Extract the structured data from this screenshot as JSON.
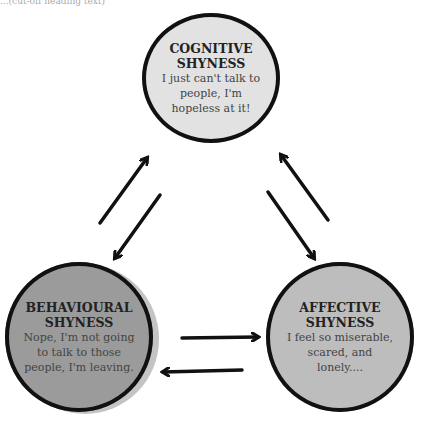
{
  "header": {
    "partial_text": "...(cut-off heading text)"
  },
  "nodes": {
    "cognitive": {
      "title": "COGNITIVE SHYNESS",
      "title_l1": "COGNITIVE",
      "title_l2": "SHYNESS",
      "desc_l1": "I just can't talk to",
      "desc_l2": "people, I'm",
      "desc_l3": "hopeless at it!",
      "fill": "#e2e2e2"
    },
    "behavioural": {
      "title_l1": "BEHAVIOURAL",
      "title_l2": "SHYNESS",
      "desc_l1": "Nope, I'm not going",
      "desc_l2": "to talk to those",
      "desc_l3": "people, I'm leaving.",
      "fill": "#9b9b9b"
    },
    "affective": {
      "title_l1": "AFFECTIVE",
      "title_l2": "SHYNESS",
      "desc_l1": "I feel so miserable,",
      "desc_l2": "scared, and",
      "desc_l3": "lonely....",
      "fill": "#bdbdbd"
    }
  },
  "edges": [
    {
      "from": "behavioural",
      "to": "cognitive",
      "bidirectional": true
    },
    {
      "from": "cognitive",
      "to": "affective",
      "bidirectional": true
    },
    {
      "from": "behavioural",
      "to": "affective",
      "bidirectional": true
    }
  ]
}
